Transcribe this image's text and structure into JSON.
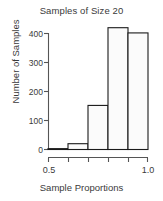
{
  "chart_data": {
    "type": "bar",
    "title": "Samples of Size 20",
    "xlabel": "Sample Proportions",
    "ylabel": "Number of Samples",
    "categories": [
      "0.5-0.6",
      "0.6-0.7",
      "0.7-0.8",
      "0.8-0.9",
      "0.9-1.0"
    ],
    "bin_edges": [
      0.5,
      0.6,
      0.7,
      0.8,
      0.9,
      1.0
    ],
    "values": [
      3,
      20,
      152,
      420,
      402
    ],
    "xlim": [
      0.5,
      1.0
    ],
    "ylim": [
      0,
      430
    ],
    "x_ticks": [
      0.5,
      0.6,
      0.7,
      0.8,
      0.9,
      1.0
    ],
    "x_tick_labels_shown": [
      "0.5",
      "1.0"
    ],
    "y_ticks": [
      0,
      100,
      200,
      300,
      400
    ],
    "y_tick_labels": [
      "0",
      "100",
      "200",
      "300",
      "400"
    ],
    "grid": false,
    "legend": null,
    "bar_fill": "#fbfbfb",
    "bar_stroke": "#1a1a1a",
    "axis_color": "#555555",
    "text_color": "#3a3a3a"
  },
  "labels": {
    "title": "Samples of Size 20",
    "xlabel": "Sample Proportions",
    "ylabel": "Number of Samples",
    "y0": "0",
    "y100": "100",
    "y200": "200",
    "y300": "300",
    "y400": "400",
    "x_left": "0.5",
    "x_right": "1.0"
  }
}
